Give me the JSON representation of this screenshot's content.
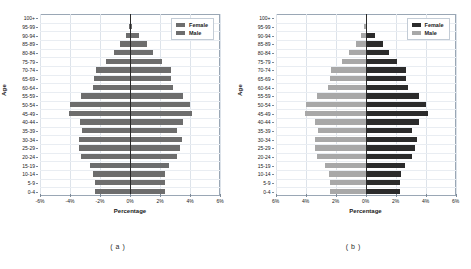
{
  "figure": {
    "panels": [
      {
        "caption": "( a )",
        "axis_style": "signed",
        "legend": [
          {
            "label": "Female",
            "color": "#6d6d6d"
          },
          {
            "label": "Male",
            "color": "#6d6d6d"
          }
        ],
        "colors": {
          "female": "#6d6d6d",
          "male": "#6d6d6d"
        }
      },
      {
        "caption": "( b )",
        "axis_style": "absolute",
        "legend": [
          {
            "label": "Female",
            "color": "#2b2b2b"
          },
          {
            "label": "Male",
            "color": "#a8a8a8"
          }
        ],
        "colors": {
          "female": "#2b2b2b",
          "male": "#a8a8a8"
        }
      }
    ]
  },
  "chart_data": [
    {
      "type": "bar",
      "subtype": "population-pyramid",
      "title": "",
      "panel_label": "( a )",
      "xlabel": "Percentage",
      "ylabel": "Age",
      "orientation": "horizontal",
      "xlim": [
        -6,
        6
      ],
      "xticks": [
        -6,
        -4,
        -2,
        0,
        2,
        4,
        6
      ],
      "xtick_labels": [
        "-6%",
        "-4%",
        "-2%",
        "0%",
        "2%",
        "4%",
        "6%"
      ],
      "grid": true,
      "legend_position": "top-right",
      "categories": [
        "0-4",
        "5-9",
        "10-14",
        "15-19",
        "20-24",
        "25-29",
        "30-34",
        "35-39",
        "40-44",
        "45-49",
        "50-54",
        "55-59",
        "60-64",
        "65-69",
        "70-74",
        "75-79",
        "80-84",
        "85-89",
        "90-94",
        "95-99",
        "100+"
      ],
      "series": [
        {
          "name": "Male",
          "side": "left",
          "color": "#6d6d6d",
          "values": [
            -2.35,
            -2.35,
            -2.45,
            -2.7,
            -3.25,
            -3.4,
            -3.4,
            -3.2,
            -3.35,
            -4.05,
            -4.0,
            -3.25,
            -2.5,
            -2.4,
            -2.3,
            -1.6,
            -1.1,
            -0.65,
            -0.3,
            -0.07,
            0.0
          ]
        },
        {
          "name": "Female",
          "side": "right",
          "color": "#6d6d6d",
          "values": [
            2.3,
            2.3,
            2.35,
            2.6,
            3.1,
            3.3,
            3.45,
            3.1,
            3.55,
            4.15,
            4.0,
            3.55,
            2.85,
            2.7,
            2.7,
            2.1,
            1.55,
            1.15,
            0.6,
            0.1,
            0.0
          ]
        }
      ]
    },
    {
      "type": "bar",
      "subtype": "population-pyramid",
      "title": "",
      "panel_label": "( b )",
      "xlabel": "Percentage",
      "ylabel": "Age",
      "orientation": "horizontal",
      "xlim": [
        -6,
        6
      ],
      "xticks": [
        -6,
        -4,
        -2,
        0,
        2,
        4,
        6
      ],
      "xtick_labels": [
        "6%",
        "4%",
        "2%",
        "0%",
        "2%",
        "4%",
        "6%"
      ],
      "grid": true,
      "legend_position": "top-right",
      "categories": [
        "0-4",
        "5-9",
        "10-14",
        "15-19",
        "20-24",
        "25-29",
        "30-34",
        "35-39",
        "40-44",
        "45-49",
        "50-54",
        "55-59",
        "60-64",
        "65-69",
        "70-74",
        "75-79",
        "80-84",
        "85-89",
        "90-94",
        "95-99",
        "100+"
      ],
      "series": [
        {
          "name": "Male",
          "side": "left",
          "color": "#a8a8a8",
          "values": [
            -2.35,
            -2.35,
            -2.45,
            -2.7,
            -3.25,
            -3.4,
            -3.4,
            -3.2,
            -3.35,
            -4.05,
            -4.0,
            -3.25,
            -2.5,
            -2.4,
            -2.3,
            -1.6,
            -1.1,
            -0.65,
            -0.3,
            -0.07,
            0.0
          ]
        },
        {
          "name": "Female",
          "side": "right",
          "color": "#2b2b2b",
          "values": [
            2.3,
            2.3,
            2.35,
            2.6,
            3.1,
            3.3,
            3.45,
            3.1,
            3.55,
            4.15,
            4.0,
            3.55,
            2.85,
            2.7,
            2.7,
            2.1,
            1.55,
            1.15,
            0.6,
            0.1,
            0.0
          ]
        }
      ]
    }
  ]
}
